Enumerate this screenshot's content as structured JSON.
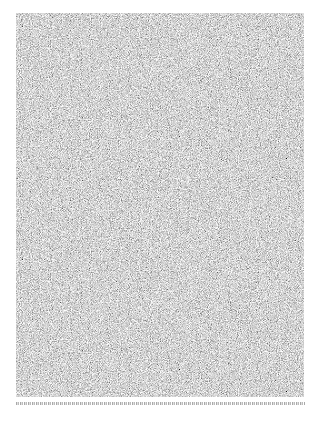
{
  "page": {
    "background_color": "#ffffff"
  },
  "figure": {
    "type": "grayscale-noise-image",
    "noise_base_color": "#a8a8a8",
    "noise_value_range": [
      "#6e6e6e",
      "#e0e0e0"
    ],
    "bounds": {
      "x": 16,
      "y": 13,
      "width": 288,
      "height": 384
    }
  },
  "caption": {
    "text": "",
    "legible": false,
    "note": "Single line of tiny illegible text below figure"
  }
}
